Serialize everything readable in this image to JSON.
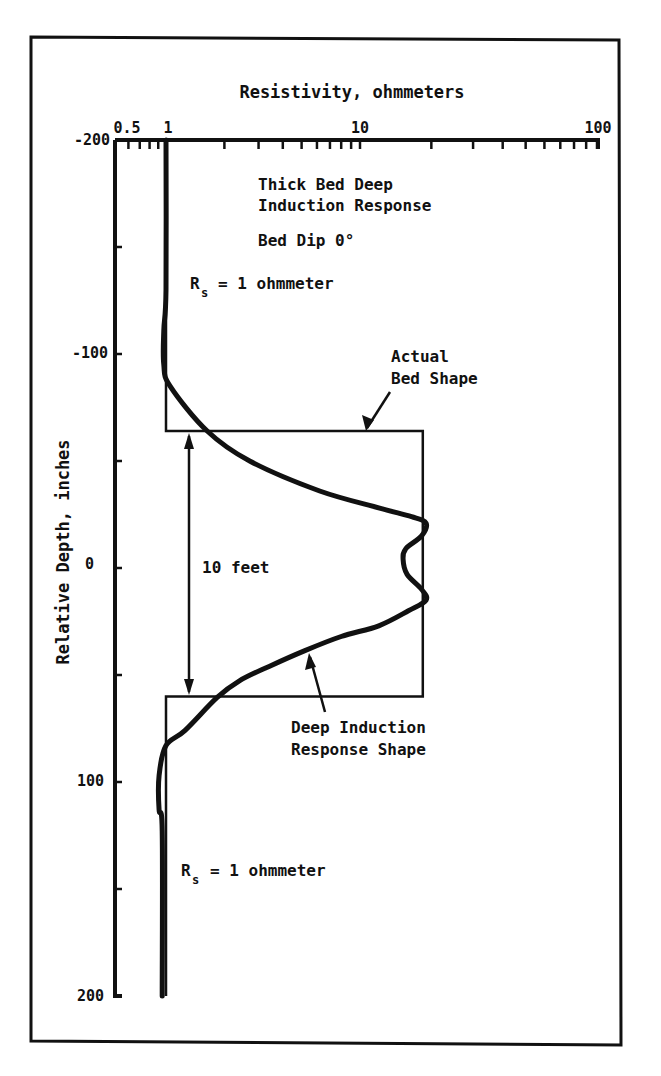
{
  "figure": {
    "x_title": "Resistivity, ohmmeters",
    "y_title": "Relative Depth, inches",
    "annotations": {
      "title_line1": "Thick Bed Deep",
      "title_line2": "Induction Response",
      "bed_dip": "Bed Dip 0°",
      "rs_top_main": "R",
      "rs_top_sub": "s",
      "rs_top_rest": "= 1 ohmmeter",
      "rs_bottom_main": "R",
      "rs_bottom_sub": "s",
      "rs_bottom_rest": "= 1 ohmmeter",
      "bed_label_line1": "Actual",
      "bed_label_line2": "Bed Shape",
      "thickness_label": "10 feet",
      "response_label_line1": "Deep Induction",
      "response_label_line2": "Response Shape"
    },
    "x_tick_labels": [
      "0.5",
      "1",
      "10",
      "100"
    ],
    "y_tick_labels": [
      "-200",
      "-100",
      "0",
      "100",
      "200"
    ]
  },
  "chart_data": {
    "type": "line",
    "title": "Thick Bed Deep Induction Response",
    "subtitle": "Bed Dip 0°",
    "xlabel": "Resistivity, ohmmeters",
    "ylabel": "Relative Depth, inches",
    "x_scale": "log",
    "xlim": [
      0.5,
      100
    ],
    "ylim": [
      -200,
      200
    ],
    "y_inverted": true,
    "x_ticks_major": [
      0.5,
      1,
      10,
      100
    ],
    "x_ticks_minor": [
      0.6,
      0.7,
      0.8,
      0.9,
      2,
      3,
      4,
      5,
      6,
      7,
      8,
      9,
      20,
      30,
      40,
      50,
      60,
      70,
      80,
      90
    ],
    "y_ticks": [
      -200,
      -150,
      -100,
      -50,
      0,
      50,
      100,
      150,
      200
    ],
    "y_tick_labels": [
      -200,
      -100,
      0,
      100,
      200
    ],
    "grid": false,
    "series": [
      {
        "name": "Actual Bed Shape",
        "style": "thin",
        "points": [
          {
            "R": 1,
            "depth": -200
          },
          {
            "R": 1,
            "depth": -64
          },
          {
            "R": 18.4,
            "depth": -64
          },
          {
            "R": 18.4,
            "depth": 60
          },
          {
            "R": 1,
            "depth": 60
          },
          {
            "R": 1,
            "depth": 200
          }
        ]
      },
      {
        "name": "Deep Induction Response Shape",
        "style": "thick",
        "points": [
          {
            "R": 1.0,
            "depth": -200
          },
          {
            "R": 1.0,
            "depth": -130
          },
          {
            "R": 0.97,
            "depth": -111
          },
          {
            "R": 0.97,
            "depth": -95
          },
          {
            "R": 1.05,
            "depth": -85
          },
          {
            "R": 1.63,
            "depth": -64
          },
          {
            "R": 2.7,
            "depth": -50
          },
          {
            "R": 6.2,
            "depth": -36
          },
          {
            "R": 12.1,
            "depth": -28
          },
          {
            "R": 16.5,
            "depth": -24
          },
          {
            "R": 19.0,
            "depth": -21
          },
          {
            "R": 18.2,
            "depth": -15
          },
          {
            "R": 15.6,
            "depth": -9
          },
          {
            "R": 15.2,
            "depth": -4
          },
          {
            "R": 15.8,
            "depth": 3
          },
          {
            "R": 18.2,
            "depth": 10
          },
          {
            "R": 19.0,
            "depth": 15
          },
          {
            "R": 16.0,
            "depth": 20
          },
          {
            "R": 12.0,
            "depth": 27
          },
          {
            "R": 8.0,
            "depth": 32
          },
          {
            "R": 5.2,
            "depth": 38.6
          },
          {
            "R": 3.4,
            "depth": 46
          },
          {
            "R": 2.4,
            "depth": 52.6
          },
          {
            "R": 1.83,
            "depth": 60.6
          },
          {
            "R": 1.25,
            "depth": 76
          },
          {
            "R": 1.0,
            "depth": 83
          },
          {
            "R": 0.91,
            "depth": 97
          },
          {
            "R": 0.91,
            "depth": 113
          },
          {
            "R": 0.95,
            "depth": 123
          },
          {
            "R": 0.95,
            "depth": 200
          }
        ]
      }
    ],
    "annotations": [
      {
        "text": "Rs = 1 ohmmeter",
        "near_depth": -130
      },
      {
        "text": "Rs = 1 ohmmeter",
        "near_depth": 145
      },
      {
        "text": "10 feet",
        "spans_depth": [
          -64,
          60
        ]
      },
      {
        "text": "Actual Bed Shape",
        "points_to": "bed top"
      },
      {
        "text": "Deep Induction Response Shape",
        "points_to": "response curve lower flank"
      }
    ]
  }
}
